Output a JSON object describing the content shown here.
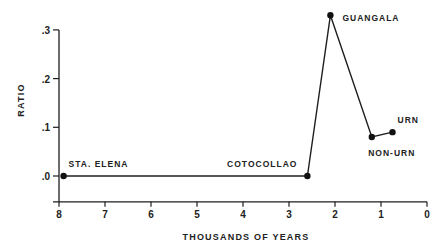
{
  "chart_data": {
    "type": "line",
    "title": "",
    "xlabel": "THOUSANDS OF YEARS",
    "ylabel": "RATIO",
    "xlim": [
      8,
      0
    ],
    "ylim": [
      -0.05,
      0.3
    ],
    "x_direction": "reversed",
    "grid": false,
    "legend": "none",
    "x_ticks": [
      {
        "value": 8,
        "label": "8"
      },
      {
        "value": 7,
        "label": "7"
      },
      {
        "value": 6,
        "label": "6"
      },
      {
        "value": 5,
        "label": "5"
      },
      {
        "value": 4,
        "label": "4"
      },
      {
        "value": 3,
        "label": "3"
      },
      {
        "value": 2,
        "label": "2"
      },
      {
        "value": 1,
        "label": "1"
      },
      {
        "value": 0,
        "label": "0"
      }
    ],
    "y_ticks": [
      {
        "value": 0.0,
        "label": ".0"
      },
      {
        "value": 0.1,
        "label": ".1"
      },
      {
        "value": 0.2,
        "label": ".2"
      },
      {
        "value": 0.3,
        "label": ".3"
      }
    ],
    "series": [
      {
        "name": "ratio",
        "color": "#1e1e1e",
        "points": [
          {
            "x": 7.9,
            "y": 0.0,
            "label": "STA. ELENA",
            "label_position": "above-right"
          },
          {
            "x": 2.6,
            "y": 0.0,
            "label": "COTOCOLLAO",
            "label_position": "above-left"
          },
          {
            "x": 2.1,
            "y": 0.33,
            "label": "GUANGALA",
            "label_position": "right"
          },
          {
            "x": 1.2,
            "y": 0.08,
            "label": "NON-URN",
            "label_position": "below"
          },
          {
            "x": 0.75,
            "y": 0.09,
            "label": "URN",
            "label_position": "above-right"
          }
        ]
      }
    ]
  }
}
